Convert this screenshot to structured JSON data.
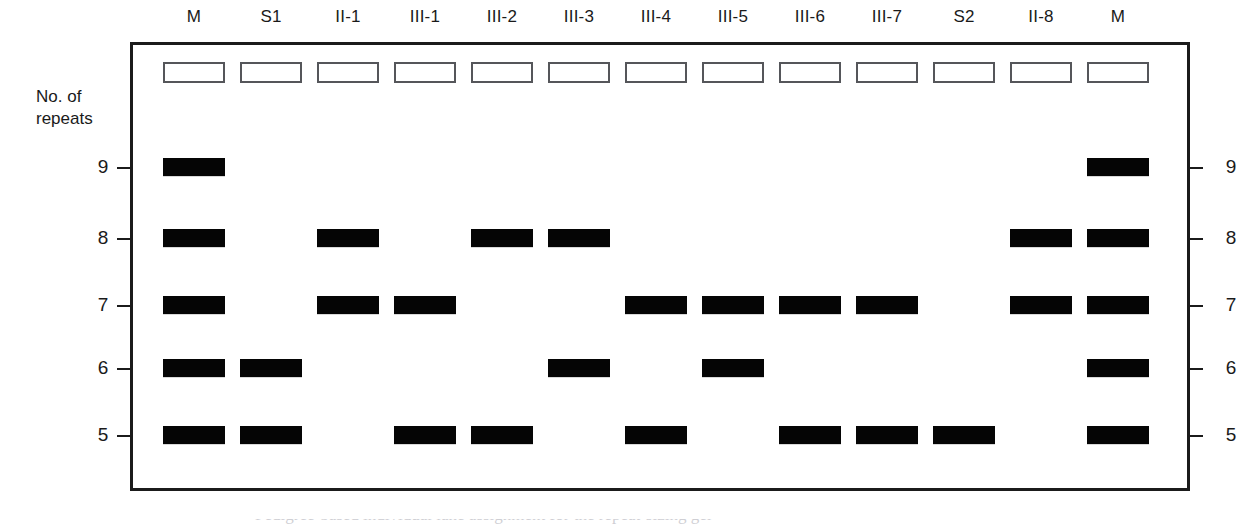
{
  "figure": {
    "axis_title_line1": "No. of",
    "axis_title_line2": "repeats",
    "caption_clipped": "Pedigree-based individual lane assignment for the repeat-sizing gel"
  },
  "chart_data": {
    "type": "table",
    "title": "",
    "subtitle": "",
    "xlabel": "",
    "ylabel": "No. of repeats",
    "grid": false,
    "legend": "none",
    "axis_tick_labels_left": [
      "9",
      "8",
      "7",
      "6",
      "5"
    ],
    "axis_tick_labels_right": [
      "9",
      "8",
      "7",
      "6",
      "5"
    ],
    "repeat_values": [
      9,
      8,
      7,
      6,
      5
    ],
    "lane_labels": [
      "M",
      "S1",
      "II-1",
      "III-1",
      "III-2",
      "III-3",
      "III-4",
      "III-5",
      "III-6",
      "III-7",
      "S2",
      "II-8",
      "M"
    ],
    "wells_present": [
      true,
      true,
      true,
      true,
      true,
      true,
      true,
      true,
      true,
      true,
      true,
      true,
      true
    ],
    "band_matrix": [
      {
        "repeats": 9,
        "lanes": [
          1,
          0,
          0,
          0,
          0,
          0,
          0,
          0,
          0,
          0,
          0,
          0,
          1
        ]
      },
      {
        "repeats": 8,
        "lanes": [
          1,
          0,
          1,
          0,
          1,
          1,
          0,
          0,
          0,
          0,
          0,
          1,
          1
        ]
      },
      {
        "repeats": 7,
        "lanes": [
          1,
          0,
          1,
          1,
          0,
          0,
          1,
          1,
          1,
          1,
          0,
          1,
          1
        ]
      },
      {
        "repeats": 6,
        "lanes": [
          1,
          1,
          0,
          0,
          0,
          1,
          0,
          1,
          0,
          0,
          0,
          0,
          1
        ]
      },
      {
        "repeats": 5,
        "lanes": [
          1,
          1,
          0,
          1,
          1,
          0,
          1,
          0,
          1,
          1,
          1,
          0,
          1
        ]
      }
    ],
    "genotypes_per_lane": [
      {
        "lane": "M",
        "alleles": [
          9,
          8,
          7,
          6,
          5
        ]
      },
      {
        "lane": "S1",
        "alleles": [
          6,
          5
        ]
      },
      {
        "lane": "II-1",
        "alleles": [
          8,
          7
        ]
      },
      {
        "lane": "III-1",
        "alleles": [
          7,
          5
        ]
      },
      {
        "lane": "III-2",
        "alleles": [
          8,
          5
        ]
      },
      {
        "lane": "III-3",
        "alleles": [
          8,
          6
        ]
      },
      {
        "lane": "III-4",
        "alleles": [
          7,
          5
        ]
      },
      {
        "lane": "III-5",
        "alleles": [
          7,
          6
        ]
      },
      {
        "lane": "III-6",
        "alleles": [
          7,
          5
        ]
      },
      {
        "lane": "III-7",
        "alleles": [
          7,
          5
        ]
      },
      {
        "lane": "S2",
        "alleles": [
          5
        ]
      },
      {
        "lane": "II-8",
        "alleles": [
          8,
          7
        ]
      },
      {
        "lane": "M",
        "alleles": [
          9,
          8,
          7,
          6,
          5
        ]
      }
    ],
    "colors": {
      "band": "#050505",
      "frame": "#1b1b1b",
      "well_border": "#55565a",
      "background": "#ffffff",
      "text": "#1a1a1a"
    },
    "geometry": {
      "lane_first_center_x": 194,
      "lane_pitch_x": 77,
      "band_width": 62,
      "row_y": {
        "9": 167,
        "8": 238,
        "7": 305,
        "6": 368,
        "5": 435
      }
    }
  }
}
